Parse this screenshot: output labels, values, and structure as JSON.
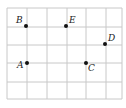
{
  "diagram": {
    "type": "grid-points",
    "grid": {
      "columns": 6,
      "rows": 5,
      "vertical_lines_x": [
        7,
        27,
        47,
        67,
        86,
        106,
        122
      ],
      "horizontal_lines_y": [
        8,
        27,
        45,
        63,
        82,
        99
      ],
      "line_color": "#c8c8c8"
    },
    "points": [
      {
        "label": "B",
        "x": 26,
        "y": 26,
        "label_dx": -10,
        "label_dy": -3
      },
      {
        "label": "E",
        "x": 66,
        "y": 26,
        "label_dx": 3,
        "label_dy": -3
      },
      {
        "label": "D",
        "x": 105,
        "y": 44,
        "label_dx": 3,
        "label_dy": -3
      },
      {
        "label": "A",
        "x": 27,
        "y": 63,
        "label_dx": -10,
        "label_dy": 5
      },
      {
        "label": "C",
        "x": 86,
        "y": 63,
        "label_dx": 2,
        "label_dy": 8
      }
    ],
    "point_color": "#111111"
  }
}
